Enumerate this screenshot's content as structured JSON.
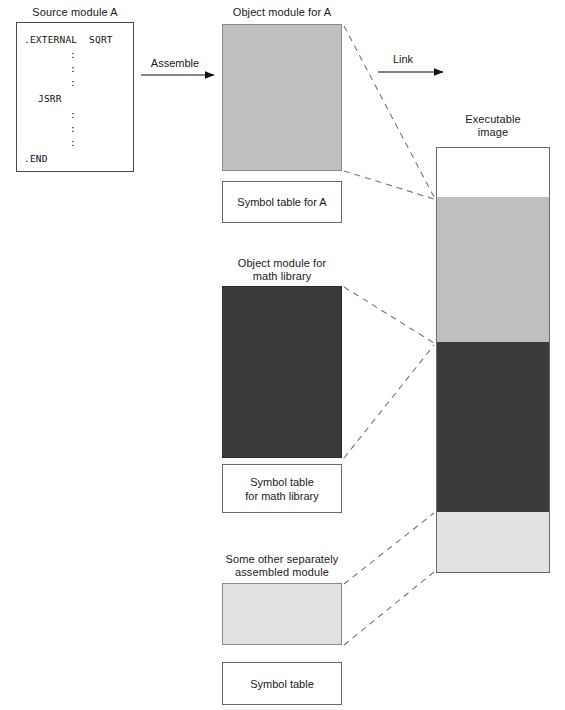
{
  "diagram": {
    "title_source_module": "Source module A",
    "title_object_a": "Object module for A",
    "title_symbol_a": "Symbol table for A",
    "title_object_math": "Object module for\nmath library",
    "title_symbol_math": "Symbol table\nfor math library",
    "title_other_module": "Some other separately\nassembled module",
    "title_symbol_other": "Symbol table",
    "title_executable": "Executable\nimage",
    "arrow_assemble": "Assemble",
    "arrow_link": "Link"
  },
  "source_code": {
    "line_1": ".EXTERNAL  SQRT",
    "line_2": ":",
    "line_3": ":",
    "line_4": ":",
    "line_5": "JSRR",
    "line_6": ":",
    "line_7": ":",
    "line_8": ":",
    "line_9": ".END"
  },
  "colors": {
    "medium_gray": "#c0c0c0",
    "dark_gray": "#3a3a3a",
    "light_gray": "#e2e2e2",
    "white": "#ffffff",
    "border": "#6b6b6b",
    "line": "#555555"
  },
  "executable_segments": [
    {
      "name": "unfilled-top",
      "fill": "#ffffff"
    },
    {
      "name": "module-a-code",
      "fill": "#c0c0c0"
    },
    {
      "name": "math-library-code",
      "fill": "#3a3a3a"
    },
    {
      "name": "other-module-code",
      "fill": "#e2e2e2"
    }
  ]
}
